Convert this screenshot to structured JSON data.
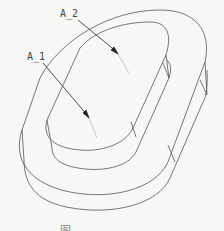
{
  "figure": {
    "type": "cad-line-drawing",
    "labels": [
      {
        "id": "A_1",
        "text": "A_1"
      },
      {
        "id": "A_2",
        "text": "A_2"
      }
    ],
    "caption": "图",
    "colors": {
      "background": "#f7f7f5",
      "line": "#555555",
      "arrow": "#222222",
      "label": "#444444"
    }
  }
}
